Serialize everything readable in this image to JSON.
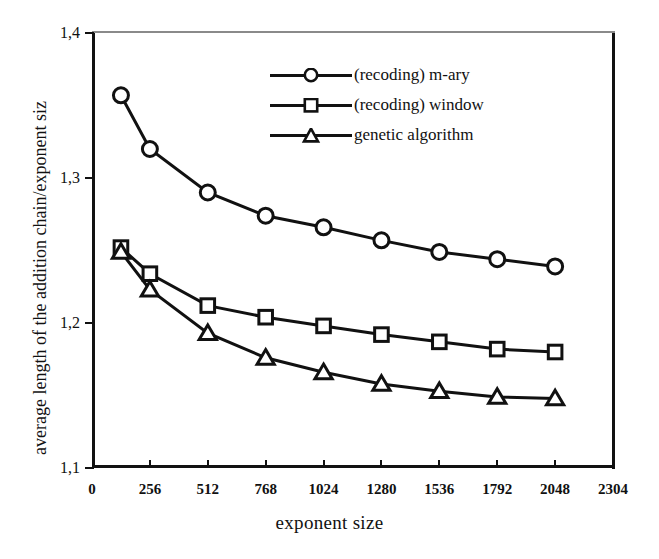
{
  "chart_data": {
    "type": "line",
    "title": "",
    "xlabel": "exponent size",
    "ylabel": "average length of the addition chain/exponent siz",
    "x": [
      128,
      256,
      512,
      768,
      1024,
      1280,
      1536,
      1792,
      2048
    ],
    "xlim": [
      0,
      2304
    ],
    "ylim": [
      1.1,
      1.4
    ],
    "xticks": [
      0,
      256,
      512,
      768,
      1024,
      1280,
      1536,
      1792,
      2048,
      2304
    ],
    "xtick_labels": [
      "0",
      "256",
      "512",
      "768",
      "1024",
      "1280",
      "1536",
      "1792",
      "2048",
      "2304"
    ],
    "yticks": [
      1.1,
      1.2,
      1.3,
      1.4
    ],
    "ytick_labels": [
      "1,1",
      "1,2",
      "1,3",
      "1,4"
    ],
    "grid": false,
    "legend_position": "upper right",
    "series": [
      {
        "name": "(recoding) m-ary",
        "marker": "circle",
        "values": [
          1.357,
          1.32,
          1.29,
          1.274,
          1.266,
          1.257,
          1.249,
          1.244,
          1.239
        ]
      },
      {
        "name": "(recoding) window",
        "marker": "square",
        "values": [
          1.252,
          1.234,
          1.212,
          1.204,
          1.198,
          1.192,
          1.187,
          1.182,
          1.18
        ]
      },
      {
        "name": "genetic algorithm",
        "marker": "triangle",
        "values": [
          1.249,
          1.223,
          1.193,
          1.176,
          1.166,
          1.158,
          1.153,
          1.149,
          1.148
        ]
      }
    ],
    "colors": {
      "line": "#111111",
      "marker_fill": "#ffffff",
      "axis": "#111111"
    }
  },
  "legend": {
    "items": [
      {
        "label": "(recoding) m-ary"
      },
      {
        "label": "(recoding) window"
      },
      {
        "label": "genetic algorithm"
      }
    ]
  }
}
